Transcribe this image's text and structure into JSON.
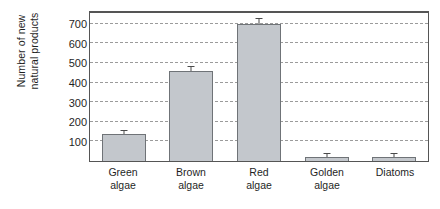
{
  "chart_data": {
    "type": "bar",
    "title": "",
    "xlabel": "",
    "ylabel": "Number of new\nnatural products",
    "categories": [
      "Green\nalgae",
      "Brown\nalgae",
      "Red\nalgae",
      "Golden\nalgae",
      "Diatoms"
    ],
    "values": [
      140,
      460,
      697,
      18,
      22
    ],
    "errors": [
      8,
      22,
      25,
      3,
      4
    ],
    "ylim": [
      0,
      760
    ],
    "yticks": [
      100,
      200,
      300,
      400,
      500,
      600,
      700
    ],
    "ytick_labels": [
      "100",
      "200",
      "300",
      "400",
      "500",
      "600",
      "700"
    ],
    "grid": true,
    "grid_style": "dashed",
    "legend": "none",
    "bar_fill": "#c3c7cc",
    "bar_edge": "#6f7377",
    "axis_color": "#555555",
    "error_bar_color": "#4a4a4a",
    "background": "#ffffff"
  }
}
